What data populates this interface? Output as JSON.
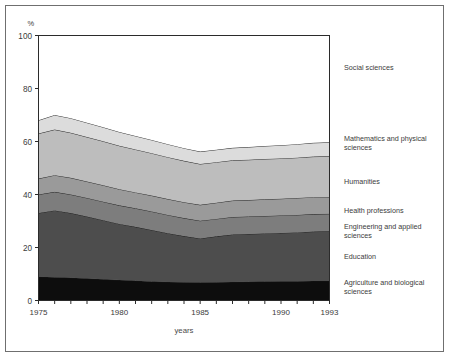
{
  "chart_data": {
    "type": "area",
    "stacked": true,
    "title": "",
    "xlabel": "years",
    "ylabel": "",
    "yunit": "%",
    "xlim": [
      1975,
      1993
    ],
    "ylim": [
      0,
      100
    ],
    "yticks": [
      0,
      20,
      40,
      60,
      80,
      100
    ],
    "ytick_labels": [
      "0",
      "20",
      "40",
      "60",
      "80",
      "100"
    ],
    "xticks": [
      1975,
      1980,
      1985,
      1990,
      1993
    ],
    "xtick_labels": [
      "1975",
      "1980",
      "1985",
      "1990",
      "1993"
    ],
    "x_minor_tick_interval": 1,
    "grid": false,
    "legend_position": "right-outside",
    "x": [
      1975,
      1976,
      1977,
      1978,
      1979,
      1980,
      1981,
      1982,
      1983,
      1984,
      1985,
      1986,
      1987,
      1988,
      1989,
      1990,
      1991,
      1992,
      1993
    ],
    "series": [
      {
        "name": "Agriculture and biological sciences",
        "color": "#0d0d0d",
        "values": [
          9.0,
          8.8,
          8.6,
          8.3,
          8.0,
          7.7,
          7.5,
          7.2,
          7.0,
          6.9,
          6.8,
          6.9,
          7.0,
          7.1,
          7.2,
          7.3,
          7.3,
          7.4,
          7.4
        ]
      },
      {
        "name": "Education",
        "color": "#4d4d4d",
        "values": [
          24.0,
          25.2,
          24.4,
          23.4,
          22.3,
          21.2,
          20.3,
          19.4,
          18.4,
          17.4,
          16.6,
          17.3,
          17.9,
          18.0,
          18.1,
          18.2,
          18.4,
          18.6,
          18.7
        ]
      },
      {
        "name": "Engineering and applied sciences",
        "color": "#7d7d7d",
        "values": [
          7.0,
          7.0,
          7.0,
          7.0,
          7.0,
          7.0,
          7.0,
          7.0,
          6.9,
          6.8,
          6.7,
          6.6,
          6.6,
          6.6,
          6.6,
          6.6,
          6.6,
          6.6,
          6.6
        ]
      },
      {
        "name": "Health professions",
        "color": "#9a9a9a",
        "values": [
          6.0,
          6.3,
          6.3,
          6.2,
          6.2,
          6.1,
          6.0,
          6.0,
          6.0,
          6.0,
          6.0,
          6.1,
          6.2,
          6.2,
          6.3,
          6.3,
          6.4,
          6.4,
          6.4
        ]
      },
      {
        "name": "Humanities",
        "color": "#bdbdbd",
        "values": [
          17.0,
          17.2,
          17.0,
          16.8,
          16.6,
          16.4,
          16.2,
          16.0,
          15.8,
          15.6,
          15.4,
          15.3,
          15.2,
          15.2,
          15.2,
          15.2,
          15.2,
          15.3,
          15.3
        ]
      },
      {
        "name": "Mathematics and physical sciences",
        "color": "#dcdcdc",
        "values": [
          5.0,
          5.5,
          5.5,
          5.4,
          5.3,
          5.2,
          5.1,
          5.0,
          4.9,
          4.8,
          4.7,
          4.7,
          4.7,
          4.8,
          4.9,
          5.0,
          5.1,
          5.2,
          5.3
        ]
      },
      {
        "name": "Social sciences",
        "color": "#ffffff",
        "values": [
          32.0,
          30.0,
          31.2,
          32.9,
          34.6,
          36.4,
          37.9,
          39.4,
          41.0,
          42.5,
          43.8,
          43.1,
          42.4,
          42.1,
          41.7,
          41.4,
          41.0,
          40.5,
          40.3
        ]
      }
    ],
    "cumulative_upper_boundaries_note": "Boundaries read from axis: 1975 -> 9, 33, 40, 46, 63, 68; 1985 -> 6.8, 23.4, 30.1, 36.1, 51.5, 56.2; 1993 -> 7.4, 26.1, 32.7, 39.1, 54.4, 59.7",
    "legend_entries": [
      {
        "label": "Social sciences"
      },
      {
        "label": "Mathematics and physical sciences"
      },
      {
        "label": "Humanities"
      },
      {
        "label": "Health professions"
      },
      {
        "label": "Engineering and applied sciences"
      },
      {
        "label": "Education"
      },
      {
        "label": "Agriculture and biological sciences"
      }
    ]
  },
  "legend": {
    "items": [
      {
        "label": "Social sciences",
        "top": 63
      },
      {
        "label": "Mathematics and physical sciences",
        "top": 134
      },
      {
        "label": "Humanities",
        "top": 177
      },
      {
        "label": "Health professions",
        "top": 206
      },
      {
        "label": "Engineering and applied sciences",
        "top": 222
      },
      {
        "label": "Education",
        "top": 252
      },
      {
        "label": "Agriculture and biological sciences",
        "top": 278
      }
    ]
  }
}
